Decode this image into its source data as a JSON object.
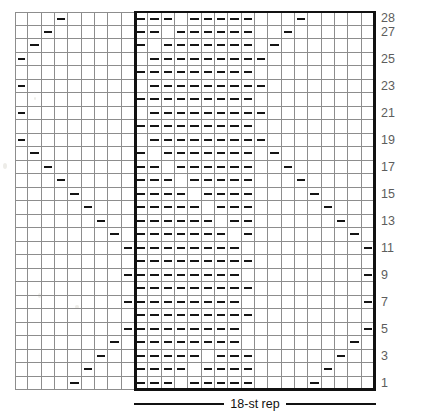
{
  "chart_data": {
    "type": "table",
    "grid": {
      "columns": 27,
      "rows": 28
    },
    "symbols": {
      "dash": "purl-dash",
      "blank": "knit-blank"
    },
    "row_numbers": [
      1,
      3,
      5,
      7,
      9,
      11,
      13,
      15,
      17,
      19,
      21,
      23,
      25,
      27,
      28
    ],
    "repeat": {
      "label": "18-st rep",
      "stitch_count": 18,
      "start_column": 10,
      "end_column": 27
    },
    "axis_note": "Rows numbered bottom-to-top on the right edge; columns read right-to-left.",
    "colors": {
      "grid_line": "#8d8d8d",
      "symbol": "#141414",
      "repeat_box": "#111111",
      "row_number": "#5d5d5d",
      "background": "#ffffff"
    },
    "marked_cells_by_row": {
      "28": [
        1,
        2,
        3,
        5,
        6,
        7,
        8,
        9,
        13
      ],
      "27": [
        1,
        2,
        4,
        5,
        6,
        7,
        8,
        9,
        12
      ],
      "26": [
        1,
        3,
        4,
        5,
        6,
        7,
        8,
        9,
        11
      ],
      "25": [
        2,
        3,
        4,
        5,
        6,
        7,
        8,
        9,
        10
      ],
      "24": [
        1,
        2,
        3,
        4,
        5,
        6,
        7,
        8,
        9
      ],
      "23": [
        2,
        3,
        4,
        5,
        6,
        7,
        8,
        9,
        10
      ],
      "22": [
        1,
        2,
        3,
        4,
        5,
        6,
        7,
        8,
        9
      ],
      "21": [
        2,
        3,
        4,
        5,
        6,
        7,
        8,
        9,
        10
      ],
      "20": [
        1,
        2,
        3,
        4,
        5,
        6,
        7,
        8,
        9
      ],
      "19": [
        2,
        3,
        4,
        5,
        6,
        7,
        8,
        9,
        10
      ],
      "18": [
        1,
        3,
        4,
        5,
        6,
        7,
        8,
        9,
        11
      ],
      "17": [
        1,
        2,
        4,
        5,
        6,
        7,
        8,
        9,
        12
      ],
      "16": [
        1,
        2,
        3,
        5,
        6,
        7,
        8,
        9,
        13
      ],
      "15": [
        1,
        2,
        3,
        4,
        6,
        7,
        8,
        9,
        14
      ],
      "14": [
        1,
        2,
        3,
        4,
        5,
        7,
        8,
        9,
        15
      ],
      "13": [
        1,
        2,
        3,
        4,
        5,
        6,
        8,
        9,
        16
      ],
      "12": [
        1,
        2,
        3,
        4,
        5,
        6,
        7,
        9,
        17
      ],
      "11": [
        1,
        2,
        3,
        4,
        5,
        6,
        7,
        8,
        18
      ],
      "10": [
        1,
        2,
        3,
        4,
        5,
        6,
        7,
        8,
        9
      ],
      "9": [
        1,
        2,
        3,
        4,
        5,
        6,
        7,
        8,
        18
      ],
      "8": [
        1,
        2,
        3,
        4,
        5,
        6,
        7,
        8,
        9
      ],
      "7": [
        1,
        2,
        3,
        4,
        5,
        6,
        7,
        8,
        18
      ],
      "6": [
        1,
        2,
        3,
        4,
        5,
        6,
        7,
        8,
        9
      ],
      "5": [
        1,
        2,
        3,
        4,
        5,
        6,
        7,
        8,
        18
      ],
      "4": [
        1,
        2,
        3,
        4,
        5,
        6,
        7,
        8,
        17
      ],
      "3": [
        1,
        2,
        3,
        4,
        5,
        7,
        8,
        9,
        16
      ],
      "2": [
        1,
        2,
        3,
        4,
        6,
        7,
        8,
        9,
        15
      ],
      "1": [
        1,
        2,
        3,
        5,
        6,
        7,
        8,
        9,
        14
      ]
    },
    "left_diagonal_by_row": {
      "28": [
        4
      ],
      "27": [
        3
      ],
      "26": [
        2
      ],
      "25": [
        1
      ],
      "24": [],
      "23": [
        1
      ],
      "22": [],
      "21": [
        1
      ],
      "20": [],
      "19": [
        1
      ],
      "18": [
        2
      ],
      "17": [
        3
      ],
      "16": [
        4
      ],
      "15": [
        5
      ],
      "14": [
        6
      ],
      "13": [
        7
      ],
      "12": [
        8
      ],
      "11": [
        9
      ],
      "10": [],
      "9": [
        9
      ],
      "8": [],
      "7": [
        9
      ],
      "6": [],
      "5": [
        9
      ],
      "4": [
        8
      ],
      "3": [
        7
      ],
      "2": [
        6
      ],
      "1": [
        5
      ]
    }
  }
}
